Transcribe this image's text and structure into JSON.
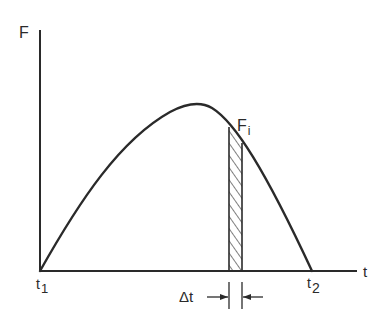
{
  "diagram": {
    "type": "force-time-impulse-graph",
    "axes": {
      "y_label": "F",
      "x_label": "t"
    },
    "labels": {
      "start_time": "t",
      "start_time_sub": "1",
      "end_time": "t",
      "end_time_sub": "2",
      "force_point": "F",
      "force_point_sub": "i",
      "interval": "Δt"
    },
    "curve": {
      "description": "Force rises from zero at t1 to a maximum, then falls to zero at t2",
      "shape": "asymmetric hump"
    },
    "strip": {
      "description": "Hatched narrow vertical strip of width Δt under the curve at F_i",
      "fill": "diagonal hatch"
    },
    "colors": {
      "ink": "#2a2a2a",
      "background": "#ffffff"
    }
  }
}
